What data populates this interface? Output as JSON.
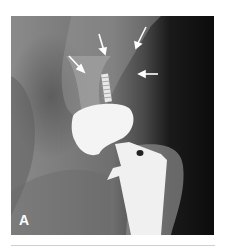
{
  "figure": {
    "panel_label": "A",
    "arrows_count": 4,
    "colors": {
      "background": "#ffffff",
      "implant": "#f2f2f2",
      "soft_tissue": "#7a7a7a",
      "dark_region": "#0c0c0c"
    }
  }
}
